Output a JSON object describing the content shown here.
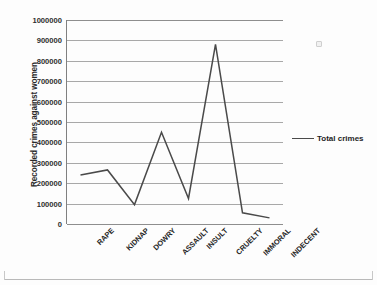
{
  "chart_data": {
    "type": "line",
    "title": "",
    "subtitle": "",
    "xlabel": "",
    "ylabel": "Recorded crimes against women",
    "categories": [
      "RAPE",
      "KIDNAP",
      "DOWRY",
      "ASSAULT",
      "INSULT",
      "CRUELTY",
      "IMMORAL",
      "INDECENT"
    ],
    "series": [
      {
        "name": "Total crimes",
        "values": [
          240000,
          265000,
          95000,
          450000,
          125000,
          880000,
          55000,
          30000
        ],
        "color": "#4a4a4a"
      }
    ],
    "ylim": [
      0,
      1000000
    ],
    "ytick_step": 100000,
    "ytick_labels": [
      "0",
      "100000",
      "200000",
      "300000",
      "400000",
      "500000",
      "600000",
      "700000",
      "800000",
      "900000",
      "1000000"
    ],
    "grid": true,
    "grid_axis": "y",
    "legend": {
      "position": "right",
      "entries": [
        "Total crimes"
      ]
    },
    "xtick_rotation": -45
  },
  "legend": {
    "label": "Total crimes"
  },
  "axes": {
    "y_title": "Recorded crimes against women"
  },
  "artifacts": {
    "speck": "scan-speck"
  }
}
